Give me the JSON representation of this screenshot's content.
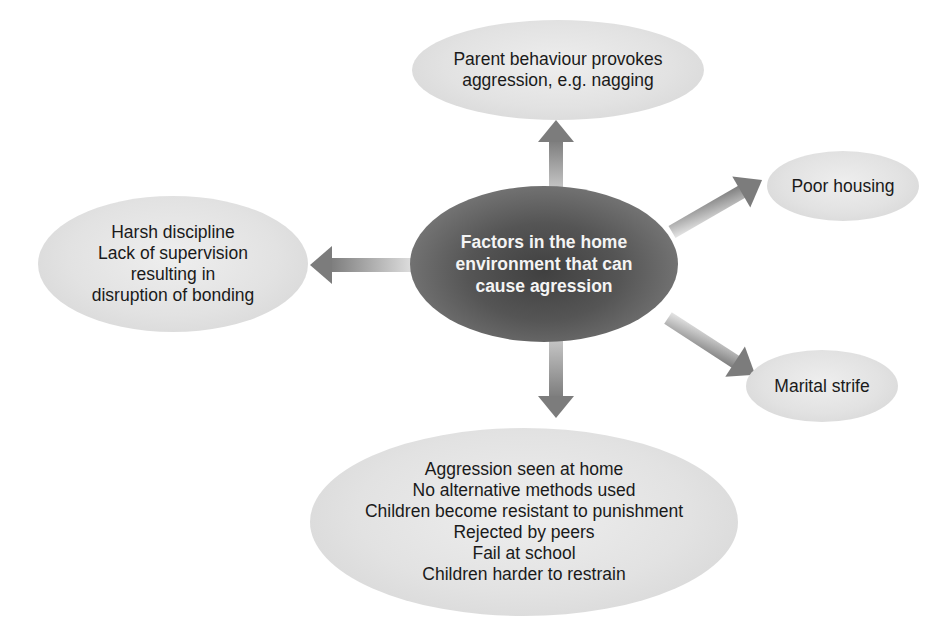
{
  "diagram": {
    "type": "spider-diagram",
    "center": {
      "text": "Factors in the home\nenvironment that can\ncause agression"
    },
    "nodes": {
      "top": {
        "text": "Parent behaviour provokes\naggression, e.g. nagging"
      },
      "left": {
        "text": "Harsh discipline\nLack of supervision\nresulting in\ndisruption of bonding"
      },
      "upper_right": {
        "text": "Poor housing"
      },
      "lower_right": {
        "text": "Marital strife"
      },
      "bottom": {
        "text": "Aggression seen at home\nNo alternative methods used\nChildren become resistant to punishment\nRejected by peers\nFail at school\nChildren harder to restrain"
      }
    },
    "colors": {
      "center_fill": "#555555",
      "node_fill": "#e4e4e4",
      "arrow_fill": "#8a8a8a",
      "text": "#1a1a1a",
      "center_text": "#f4f4f4"
    }
  }
}
